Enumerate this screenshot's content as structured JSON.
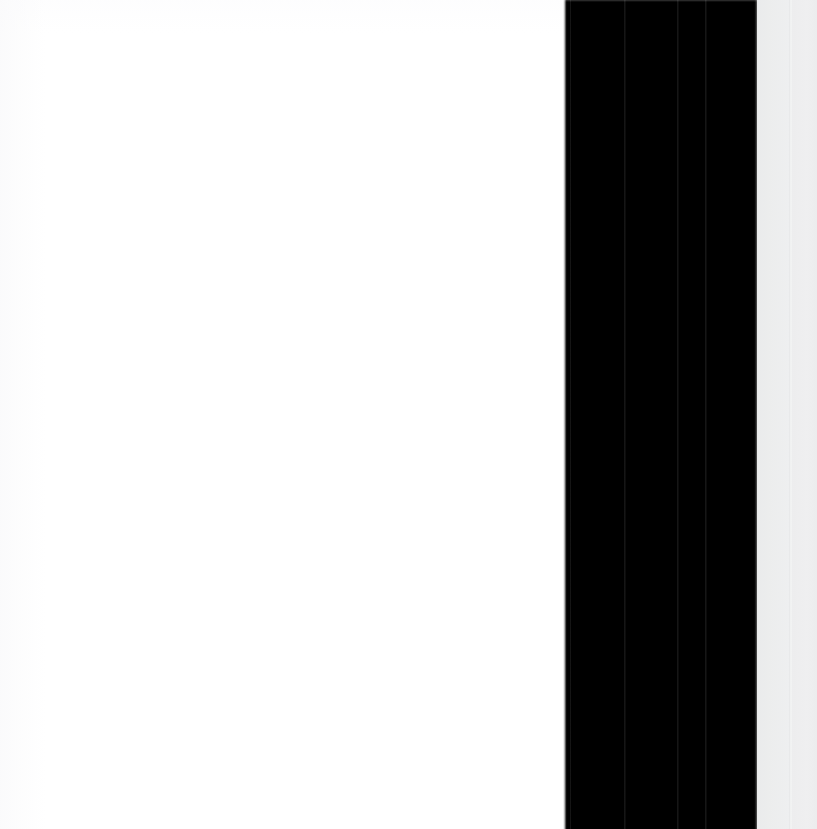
{
  "capture": {
    "title": "Zoomed UI Region",
    "width": 817,
    "height": 829,
    "description": "Extreme close-up crop of an application window edge: a blank white content surface on the left, a solid black vertical panel band in the center-right, and two pale gray panel strips at the far right."
  },
  "regions": [
    {
      "id": "content-surface",
      "label": "Content Surface",
      "role": "blank white document area",
      "x": 0,
      "y": 0,
      "width": 566,
      "height": 829,
      "color": "#ffffff"
    },
    {
      "id": "dark-panel",
      "label": "Dark Panel",
      "role": "solid black vertical band",
      "x": 566,
      "y": 0,
      "width": 191,
      "height": 829,
      "color": "#000000"
    },
    {
      "id": "gray-strip-a",
      "label": "Gray Strip A",
      "role": "pale gray vertical strip",
      "x": 757,
      "y": 0,
      "width": 33,
      "height": 829,
      "color": "#eceded"
    },
    {
      "id": "gray-strip-divider",
      "label": "Strip Divider",
      "role": "light seam between gray strips",
      "x": 789,
      "y": 0,
      "width": 4,
      "height": 829,
      "color": "#f4f5f5"
    },
    {
      "id": "gray-strip-b",
      "label": "Gray Strip B",
      "role": "pale gray vertical strip",
      "x": 792,
      "y": 0,
      "width": 25,
      "height": 829,
      "color": "#eeeff0"
    }
  ],
  "seams": [
    {
      "id": "seam-1",
      "label": "Panel Seam 1",
      "x": 570,
      "color": "#262626"
    },
    {
      "id": "seam-2",
      "label": "Panel Seam 2",
      "x": 624,
      "color": "#2e2e2e"
    },
    {
      "id": "seam-3",
      "label": "Panel Seam 3",
      "x": 677,
      "color": "#2e2e2e"
    },
    {
      "id": "seam-4",
      "label": "Panel Seam 4",
      "x": 705,
      "color": "#2e2e2e"
    }
  ],
  "edges": {
    "dark_panel_left_edge_x": 563,
    "dark_panel_right_edge_x": 754,
    "top_hairline_color": "#ffffff"
  },
  "palette": {
    "white": "#ffffff",
    "black": "#000000",
    "gray_light": "#eceded",
    "gray_lighter": "#f4f5f5",
    "gray_mid": "#e4e5e6",
    "seam": "#2e2e2e"
  }
}
